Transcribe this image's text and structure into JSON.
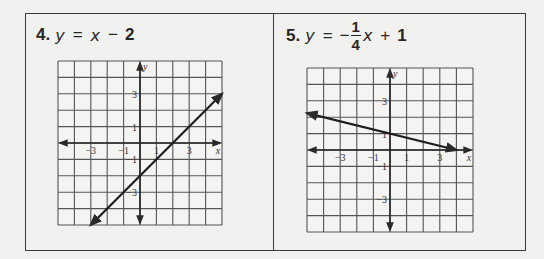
{
  "problems": [
    {
      "number": "4.",
      "equation": {
        "lhs": "y",
        "eq": "=",
        "parts": [
          "x",
          "−",
          "2"
        ]
      },
      "equation_text": "y = x − 2"
    },
    {
      "number": "5.",
      "equation": {
        "lhs": "y",
        "eq": "=",
        "sign": "−",
        "frac_num": "1",
        "frac_den": "4",
        "var": "x",
        "op": "+",
        "const": "1"
      },
      "equation_text": "y = −1/4 x + 1"
    }
  ],
  "chart_data": [
    {
      "type": "line",
      "title": "4. y = x − 2",
      "xlabel": "x",
      "ylabel": "y",
      "xlim": [
        -5,
        5
      ],
      "ylim": [
        -5,
        5
      ],
      "grid": true,
      "x_ticks": [
        "−3",
        "−1",
        "1",
        "3"
      ],
      "y_ticks": [
        "3",
        "1",
        "−1",
        "−3"
      ],
      "series": [
        {
          "name": "y = x − 2",
          "slope": 1,
          "intercept": -2,
          "x": [
            -3,
            5
          ],
          "y": [
            -5,
            3
          ]
        }
      ]
    },
    {
      "type": "line",
      "title": "5. y = −1/4 x + 1",
      "xlabel": "x",
      "ylabel": "y",
      "xlim": [
        -5,
        5
      ],
      "ylim": [
        -5,
        5
      ],
      "grid": true,
      "x_ticks": [
        "−3",
        "−1",
        "1",
        "3"
      ],
      "y_ticks": [
        "3",
        "1",
        "−1",
        "−3"
      ],
      "series": [
        {
          "name": "y = −1/4 x + 1",
          "slope": -0.25,
          "intercept": 1,
          "x": [
            -5,
            4
          ],
          "y": [
            2.25,
            0
          ]
        }
      ]
    }
  ]
}
